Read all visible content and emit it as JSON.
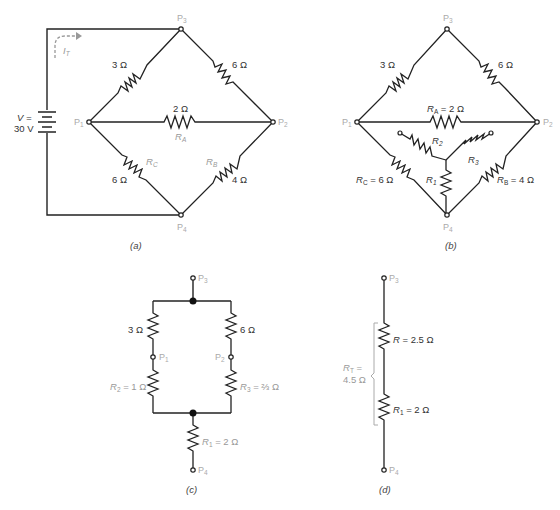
{
  "figure": {
    "panels": [
      {
        "id": "a",
        "caption": "(a)",
        "source": {
          "label_line1": "V =",
          "label_line2": "30 V",
          "current_label": "I",
          "current_sub": "T"
        },
        "nodes": {
          "p1": "P",
          "p1_sub": "1",
          "p2": "P",
          "p2_sub": "2",
          "p3": "P",
          "p3_sub": "3",
          "p4": "P",
          "p4_sub": "4"
        },
        "resistors": [
          {
            "id": "top-left",
            "value": "3 Ω",
            "name": ""
          },
          {
            "id": "top-right",
            "value": "6 Ω",
            "name": ""
          },
          {
            "id": "middle",
            "value": "2 Ω",
            "name": "R",
            "name_sub": "A"
          },
          {
            "id": "bottom-left",
            "value": "6 Ω",
            "name": "R",
            "name_sub": "C"
          },
          {
            "id": "bottom-right",
            "value": "4 Ω",
            "name": "R",
            "name_sub": "B"
          }
        ]
      },
      {
        "id": "b",
        "caption": "(b)",
        "nodes": {
          "p1": "P",
          "p1_sub": "1",
          "p2": "P",
          "p2_sub": "2",
          "p3": "P",
          "p3_sub": "3",
          "p4": "P",
          "p4_sub": "4"
        },
        "resistors": [
          {
            "id": "top-left",
            "value": "3 Ω"
          },
          {
            "id": "top-right",
            "value": "6 Ω"
          },
          {
            "id": "ra",
            "name": "R",
            "name_sub": "A",
            "value": " = 2 Ω"
          },
          {
            "id": "rc",
            "name": "R",
            "name_sub": "C",
            "value": " = 6 Ω"
          },
          {
            "id": "rb",
            "name": "R",
            "name_sub": "B",
            "value": " = 4 Ω"
          },
          {
            "id": "r1",
            "name": "R",
            "name_sub": "1"
          },
          {
            "id": "r2",
            "name": "R",
            "name_sub": "2"
          },
          {
            "id": "r3",
            "name": "R",
            "name_sub": "3"
          }
        ]
      },
      {
        "id": "c",
        "caption": "(c)",
        "nodes": {
          "p3": "P",
          "p3_sub": "3",
          "p1": "P",
          "p1_sub": "1",
          "p2": "P",
          "p2_sub": "2",
          "p4": "P",
          "p4_sub": "4"
        },
        "resistors": [
          {
            "id": "left-top",
            "value": "3 Ω"
          },
          {
            "id": "right-top",
            "value": "6 Ω"
          },
          {
            "id": "left-bottom",
            "name": "R",
            "name_sub": "2",
            "value": " = 1 Ω"
          },
          {
            "id": "right-bottom",
            "name": "R",
            "name_sub": "3",
            "value": " = ⅔ Ω"
          },
          {
            "id": "bottom",
            "name": "R",
            "name_sub": "1",
            "value": " = 2 Ω"
          }
        ]
      },
      {
        "id": "d",
        "caption": "(d)",
        "nodes": {
          "p3": "P",
          "p3_sub": "3",
          "p4": "P",
          "p4_sub": "4"
        },
        "resistors": [
          {
            "id": "top",
            "name": "R",
            "value": " = 2.5 Ω"
          },
          {
            "id": "bottom",
            "name": "R",
            "name_sub": "1",
            "value": " = 2 Ω"
          }
        ],
        "total": {
          "name": "R",
          "name_sub": "T",
          "eq": " =",
          "value": "4.5 Ω"
        }
      }
    ]
  }
}
